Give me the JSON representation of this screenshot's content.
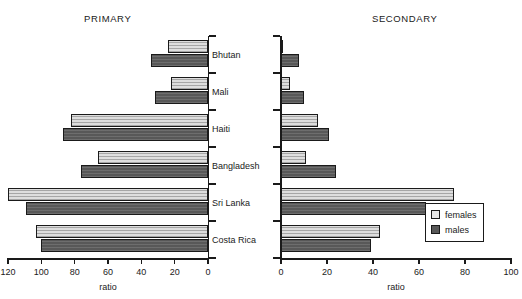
{
  "chart_data": {
    "type": "bar",
    "title": "",
    "orientation": "horizontal",
    "layout": "paired back-to-back panels (population-pyramid style)",
    "categories": [
      "Bhutan",
      "Mali",
      "Haiti",
      "Bangladesh",
      "Sri Lanka",
      "Costa Rica"
    ],
    "legend": {
      "position": "bottom-right",
      "entries": [
        {
          "key": "females",
          "label": "females",
          "color": "#e6e6e6"
        },
        {
          "key": "males",
          "label": "males",
          "color": "#585858"
        }
      ]
    },
    "panels": [
      {
        "id": "primary",
        "title": "PRIMARY",
        "xlabel": "ratio",
        "ylabel": "",
        "xlim": [
          0,
          120
        ],
        "reversed": true,
        "grid": false,
        "ticks": [
          120,
          100,
          80,
          60,
          40,
          20,
          0
        ],
        "tick_labels": [
          "120",
          "100",
          "80",
          "60",
          "40",
          "20",
          "0"
        ],
        "series": [
          {
            "name": "females",
            "values": [
              24,
              22,
              82,
              66,
              120,
              103
            ]
          },
          {
            "name": "males",
            "values": [
              34,
              32,
              87,
              76,
              109,
              100
            ]
          }
        ]
      },
      {
        "id": "secondary",
        "title": "SECONDARY",
        "xlabel": "ratio",
        "ylabel": "",
        "xlim": [
          0,
          100
        ],
        "reversed": false,
        "grid": false,
        "ticks": [
          0,
          20,
          40,
          60,
          80,
          100
        ],
        "tick_labels": [
          "0",
          "20",
          "40",
          "60",
          "80",
          "100"
        ],
        "series": [
          {
            "name": "females",
            "values": [
              1,
              4,
              16,
              11,
              75,
              43
            ]
          },
          {
            "name": "males",
            "values": [
              8,
              10,
              21,
              24,
              63,
              39
            ]
          }
        ]
      }
    ]
  }
}
